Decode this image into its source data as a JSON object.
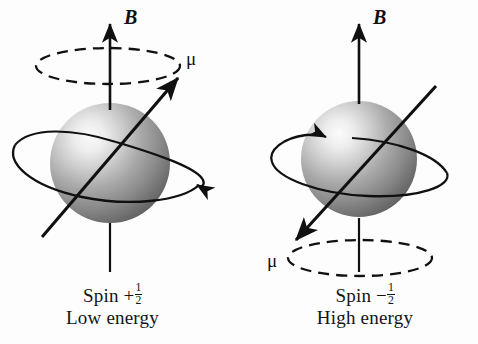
{
  "figure": {
    "background_color": "#fdfdfd",
    "stroke_color": "#101010",
    "sphere_light_color": "#f2f2f2",
    "sphere_mid_color": "#a8a8a8",
    "sphere_dark_color": "#5a5a5a"
  },
  "panels": [
    {
      "id": "low-energy",
      "field_label": "B",
      "moment_label": "μ",
      "caption_line1_prefix": "Spin +",
      "caption_fraction_numerator": "1",
      "caption_fraction_denominator": "2",
      "caption_line2": "Low energy"
    },
    {
      "id": "high-energy",
      "field_label": "B",
      "moment_label": "μ",
      "caption_line1_prefix": "Spin −",
      "caption_fraction_numerator": "1",
      "caption_fraction_denominator": "2",
      "caption_line2": "High energy"
    }
  ]
}
